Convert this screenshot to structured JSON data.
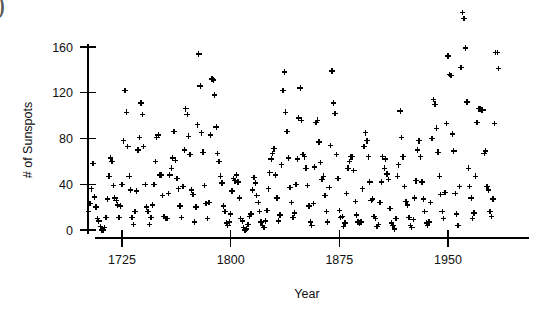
{
  "figure": {
    "corner_mark": ")"
  },
  "chart_data": {
    "type": "scatter",
    "title": "",
    "xlabel": "Year",
    "ylabel": "# of Sunspots",
    "marker": "plus",
    "marker_color": "#000000",
    "grid": false,
    "legend": null,
    "xlim": [
      1700,
      1988
    ],
    "ylim": [
      -8,
      200
    ],
    "xticks": [
      1725,
      1800,
      1875,
      1950
    ],
    "xtick_labels": [
      "1725",
      "1800",
      "1875",
      "1950"
    ],
    "yticks": [
      0,
      40,
      80,
      120,
      160
    ],
    "ytick_labels": [
      "0",
      "40",
      "80",
      "120",
      "160"
    ],
    "x": [
      1700,
      1701,
      1702,
      1703,
      1704,
      1705,
      1706,
      1707,
      1708,
      1709,
      1710,
      1711,
      1712,
      1713,
      1714,
      1715,
      1716,
      1717,
      1718,
      1719,
      1720,
      1721,
      1722,
      1723,
      1724,
      1725,
      1726,
      1727,
      1728,
      1729,
      1730,
      1731,
      1732,
      1733,
      1734,
      1735,
      1736,
      1737,
      1738,
      1739,
      1740,
      1741,
      1742,
      1743,
      1744,
      1745,
      1746,
      1747,
      1748,
      1749,
      1750,
      1751,
      1752,
      1753,
      1754,
      1755,
      1756,
      1757,
      1758,
      1759,
      1760,
      1761,
      1762,
      1763,
      1764,
      1765,
      1766,
      1767,
      1768,
      1769,
      1770,
      1771,
      1772,
      1773,
      1774,
      1775,
      1776,
      1777,
      1778,
      1779,
      1780,
      1781,
      1782,
      1783,
      1784,
      1785,
      1786,
      1787,
      1788,
      1789,
      1790,
      1791,
      1792,
      1793,
      1794,
      1795,
      1796,
      1797,
      1798,
      1799,
      1800,
      1801,
      1802,
      1803,
      1804,
      1805,
      1806,
      1807,
      1808,
      1809,
      1810,
      1811,
      1812,
      1813,
      1814,
      1815,
      1816,
      1817,
      1818,
      1819,
      1820,
      1821,
      1822,
      1823,
      1824,
      1825,
      1826,
      1827,
      1828,
      1829,
      1830,
      1831,
      1832,
      1833,
      1834,
      1835,
      1836,
      1837,
      1838,
      1839,
      1840,
      1841,
      1842,
      1843,
      1844,
      1845,
      1846,
      1847,
      1848,
      1849,
      1850,
      1851,
      1852,
      1853,
      1854,
      1855,
      1856,
      1857,
      1858,
      1859,
      1860,
      1861,
      1862,
      1863,
      1864,
      1865,
      1866,
      1867,
      1868,
      1869,
      1870,
      1871,
      1872,
      1873,
      1874,
      1875,
      1876,
      1877,
      1878,
      1879,
      1880,
      1881,
      1882,
      1883,
      1884,
      1885,
      1886,
      1887,
      1888,
      1889,
      1890,
      1891,
      1892,
      1893,
      1894,
      1895,
      1896,
      1897,
      1898,
      1899,
      1900,
      1901,
      1902,
      1903,
      1904,
      1905,
      1906,
      1907,
      1908,
      1909,
      1910,
      1911,
      1912,
      1913,
      1914,
      1915,
      1916,
      1917,
      1918,
      1919,
      1920,
      1921,
      1922,
      1923,
      1924,
      1925,
      1926,
      1927,
      1928,
      1929,
      1930,
      1931,
      1932,
      1933,
      1934,
      1935,
      1936,
      1937,
      1938,
      1939,
      1940,
      1941,
      1942,
      1943,
      1944,
      1945,
      1946,
      1947,
      1948,
      1949,
      1950,
      1951,
      1952,
      1953,
      1954,
      1955,
      1956,
      1957,
      1958,
      1959,
      1960,
      1961,
      1962,
      1963,
      1964,
      1965,
      1966,
      1967,
      1968,
      1969,
      1970,
      1971,
      1972,
      1973,
      1974,
      1975,
      1976,
      1977,
      1978,
      1979,
      1980,
      1981,
      1982,
      1983,
      1984,
      1985
    ],
    "y": [
      5,
      11,
      16,
      23,
      36,
      58,
      29,
      20,
      10,
      8,
      3,
      0,
      0,
      2,
      11,
      27,
      47,
      63,
      60,
      39,
      28,
      26,
      22,
      11,
      21,
      40,
      78,
      122,
      103,
      73,
      47,
      35,
      11,
      5,
      16,
      34,
      70,
      81,
      111,
      101,
      73,
      40,
      20,
      16,
      5,
      11,
      22,
      40,
      60,
      81,
      83,
      48,
      48,
      30,
      12,
      10,
      10,
      32,
      48,
      54,
      63,
      86,
      61,
      45,
      36,
      21,
      11,
      38,
      70,
      106,
      101,
      82,
      66,
      35,
      31,
      7,
      20,
      92,
      154,
      126,
      85,
      68,
      39,
      23,
      10,
      24,
      83,
      132,
      131,
      118,
      90,
      67,
      60,
      47,
      41,
      21,
      16,
      6,
      4,
      7,
      14,
      34,
      45,
      43,
      48,
      42,
      28,
      10,
      8,
      2,
      0,
      1,
      5,
      12,
      14,
      35,
      46,
      41,
      30,
      24,
      16,
      7,
      4,
      2,
      8,
      17,
      36,
      50,
      62,
      67,
      71,
      48,
      28,
      8,
      13,
      57,
      122,
      138,
      103,
      86,
      63,
      37,
      24,
      11,
      15,
      40,
      62,
      98,
      124,
      96,
      66,
      64,
      54,
      39,
      21,
      7,
      4,
      23,
      55,
      94,
      96,
      77,
      59,
      44,
      47,
      30,
      16,
      7,
      37,
      74,
      139,
      111,
      102,
      66,
      45,
      17,
      11,
      12,
      3,
      6,
      32,
      54,
      60,
      64,
      64,
      52,
      25,
      13,
      7,
      6,
      7,
      36,
      73,
      85,
      78,
      64,
      42,
      26,
      27,
      12,
      10,
      3,
      5,
      24,
      42,
      64,
      54,
      62,
      49,
      44,
      19,
      6,
      4,
      1,
      10,
      47,
      57,
      104,
      81,
      64,
      38,
      25,
      22,
      11,
      4,
      2,
      9,
      28,
      43,
      70,
      78,
      64,
      42,
      27,
      16,
      6,
      4,
      7,
      24,
      80,
      114,
      110,
      89,
      68,
      47,
      31,
      16,
      10,
      33,
      93,
      152,
      136,
      135,
      84,
      69,
      32,
      14,
      4,
      38,
      142,
      190,
      185,
      159,
      112,
      54,
      38,
      28,
      10,
      15,
      47,
      94,
      106,
      106,
      105,
      105,
      67,
      69,
      38,
      35,
      16,
      12,
      27,
      93,
      155,
      155,
      141,
      116,
      67,
      46
    ],
    "marker_size_px": 5.5,
    "n_points": 286,
    "clipped_above_top": [
      1957,
      1958
    ]
  }
}
